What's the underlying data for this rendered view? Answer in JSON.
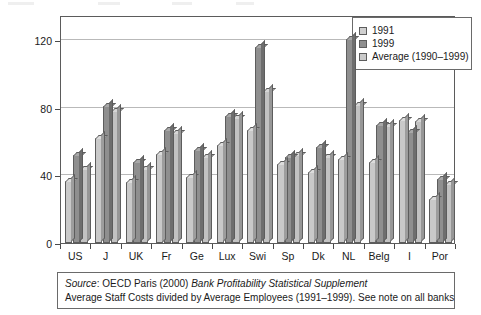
{
  "chart_data": {
    "type": "bar",
    "title": "",
    "xlabel": "",
    "ylabel": "Costs per Employee (Thousands)",
    "ylim": [
      0,
      135
    ],
    "yticks": [
      0,
      40,
      80,
      120
    ],
    "ytick_labels": [
      "0",
      "40",
      "80",
      "120"
    ],
    "grid": true,
    "legend_position": "top-right",
    "categories": [
      "US",
      "J",
      "UK",
      "Fr",
      "Ge",
      "Lux",
      "Swi",
      "Sp",
      "Dk",
      "NL",
      "Belg",
      "I",
      "Por"
    ],
    "series": [
      {
        "name": "1991",
        "color": "#c9c9c9",
        "values": [
          37,
          62,
          36,
          53,
          39,
          58,
          67,
          47,
          42,
          50,
          48,
          73,
          26
        ]
      },
      {
        "name": "1999",
        "color": "#8f8f8f",
        "values": [
          52,
          81,
          48,
          67,
          55,
          75,
          116,
          51,
          57,
          121,
          70,
          66,
          38
        ]
      },
      {
        "name": "Average (1990-1999)",
        "color": "#c2c2c2",
        "values": [
          44,
          78,
          44,
          65,
          51,
          74,
          90,
          52,
          51,
          82,
          69,
          72,
          35
        ]
      }
    ]
  },
  "legend": {
    "items": [
      {
        "label": "1991"
      },
      {
        "label": "1999"
      },
      {
        "label": "Average (1990–1999)"
      }
    ]
  },
  "axes": {
    "y_title": "Costs per Employee (Thousands)",
    "y_ticks": [
      "120",
      "80",
      "40",
      "0"
    ],
    "x_labels": [
      "US",
      "J",
      "UK",
      "Fr",
      "Ge",
      "Lux",
      "Swi",
      "Sp",
      "Dk",
      "NL",
      "Belg",
      "I",
      "Por"
    ]
  },
  "source_note": {
    "line1_prefix": "Source",
    "line1_mid": ": OECD Paris (2000) ",
    "line1_italic": "Bank Profitability Statistical Supplement",
    "line2": "Average Staff Costs divided by Average Employees (1991–1999). See note on all banks"
  }
}
